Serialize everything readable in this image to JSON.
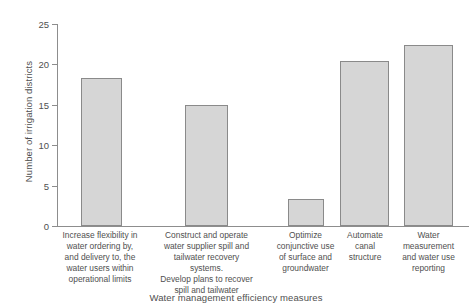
{
  "chart_data": {
    "type": "bar",
    "title": "",
    "xlabel": "Water management efficiency measures",
    "ylabel": "Number of irrigation districts",
    "categories": [
      "Increase flexibility in water ordering by, and delivery to, the water users within operational limits",
      "Construct and operate water supplier spill and tailwater recovery systems. Develop plans to recover spill and tailwater",
      "Optimize conjunctive use of surface and groundwater",
      "Automate canal structure",
      "Water measurement and water use reporting"
    ],
    "values": [
      18.3,
      15.0,
      3.3,
      20.4,
      22.4
    ],
    "ylim": [
      0,
      25
    ],
    "yticks": [
      0,
      5,
      10,
      15,
      20,
      25
    ],
    "ytick_labels": [
      "0",
      "5",
      "10",
      "15",
      "20",
      "25"
    ],
    "grid": false,
    "legend": null,
    "bar_color": "#d6d6d6",
    "bar_border_color": "#8a8a8a",
    "axis_color": "#8d8d8d",
    "text_color": "#4f4f4f"
  },
  "category_lines": [
    [
      "Increase flexibility in",
      "water ordering by,",
      "and delivery to, the",
      "water users within",
      "operational limits"
    ],
    [
      "Construct and operate",
      "water supplier spill and",
      "tailwater recovery systems.",
      "Develop plans to recover",
      "spill and tailwater"
    ],
    [
      "Optimize",
      "conjunctive use",
      "of surface and",
      "groundwater"
    ],
    [
      "Automate",
      "canal",
      "structure"
    ],
    [
      "Water",
      "measurement",
      "and water use",
      "reporting"
    ]
  ]
}
